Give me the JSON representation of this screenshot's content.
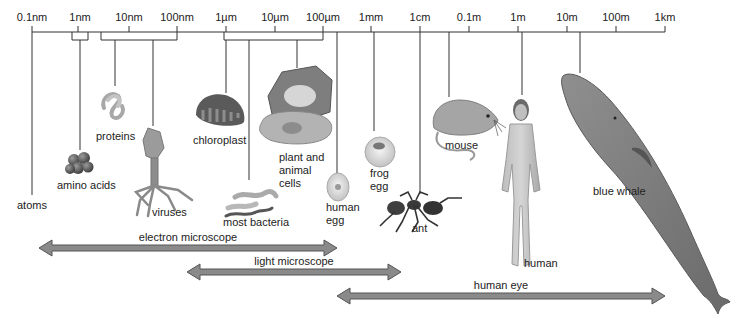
{
  "scale": {
    "ticks": [
      "0.1nm",
      "1nm",
      "10nm",
      "100nm",
      "1µm",
      "10µm",
      "100µm",
      "1mm",
      "1cm",
      "0.1m",
      "1m",
      "10m",
      "100m",
      "1km"
    ]
  },
  "objects": {
    "atoms": "atoms",
    "amino_acids": "amino acids",
    "proteins": "proteins",
    "viruses": "viruses",
    "chloroplast": "chloroplast",
    "most_bacteria": "most bacteria",
    "plant_cells_1": "plant and",
    "plant_cells_2": "animal",
    "plant_cells_3": "cells",
    "human_egg_1": "human",
    "human_egg_2": "egg",
    "frog_egg_1": "frog",
    "frog_egg_2": "egg",
    "ant": "ant",
    "mouse": "mouse",
    "human": "human",
    "blue_whale": "blue whale"
  },
  "ranges": {
    "electron": "electron microscope",
    "light": "light microscope",
    "eye": "human eye"
  },
  "colors": {
    "line": "#333333",
    "arrow_fill": "#8a8a8a",
    "arrow_stroke": "#555555",
    "organism": "#9a9a9a"
  }
}
